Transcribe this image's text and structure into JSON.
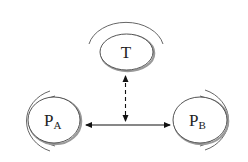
{
  "diagram": {
    "nodes": [
      {
        "id": "T",
        "label": "T",
        "sub": ""
      },
      {
        "id": "PA",
        "label": "P",
        "sub": "A"
      },
      {
        "id": "PB",
        "label": "P",
        "sub": "B"
      }
    ],
    "edges": [
      {
        "from": "PA",
        "to": "PB",
        "style": "solid",
        "direction": "bidirectional"
      },
      {
        "from": "T",
        "to": "PA-PB link",
        "style": "dashed",
        "direction": "bidirectional"
      }
    ],
    "colors": {
      "stroke": "#222222",
      "arc": "#555555",
      "shadow": "#9a9a9a",
      "background": "#ffffff"
    }
  }
}
